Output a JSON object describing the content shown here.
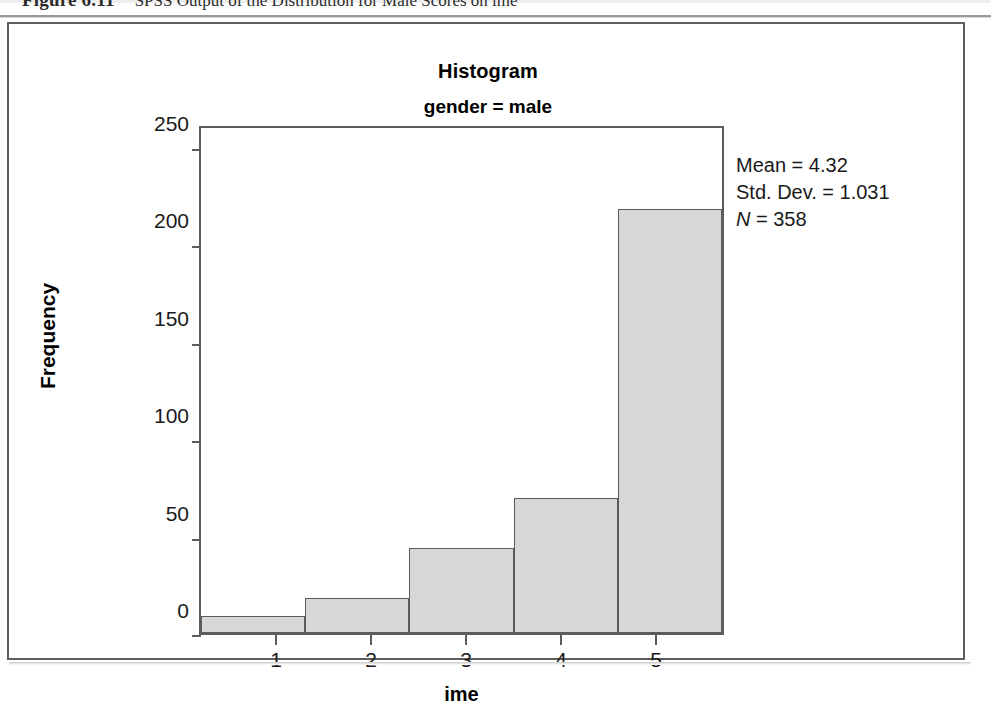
{
  "caption": {
    "label": "Figure 6.11",
    "text": "SPSS Output of the Distribution for Male Scores on ime"
  },
  "chart": {
    "title": "Histogram",
    "subtitle": "gender = male"
  },
  "stats": {
    "mean_label": "Mean = 4.32",
    "stddev_label": "Std. Dev. = 1.031",
    "n_symbol": "N",
    "n_value": " = 358"
  },
  "axes": {
    "y_title": "Frequency",
    "x_title": "ime",
    "y_ticks": [
      "250",
      "200",
      "150",
      "100",
      "50",
      "0"
    ],
    "x_ticks": [
      "1",
      "2",
      "3",
      "4",
      "5"
    ]
  },
  "chart_data": {
    "type": "bar",
    "title": "Histogram",
    "subtitle": "gender = male",
    "xlabel": "ime",
    "ylabel": "Frequency",
    "categories": [
      "1",
      "2",
      "3",
      "4",
      "5"
    ],
    "values": [
      9,
      18,
      44,
      70,
      220
    ],
    "ylim": [
      0,
      262
    ],
    "xlim": [
      0.5,
      5.5
    ],
    "ytick_values": [
      0,
      50,
      100,
      150,
      200,
      250
    ],
    "xtick_values": [
      1,
      2,
      3,
      4,
      5
    ],
    "grid": false,
    "legend": "none",
    "bar_fill_color": "#d7d7d7",
    "bar_edge_color": "#5a5a5a",
    "annotations": [
      "Mean = 4.32",
      "Std. Dev. = 1.031",
      "N = 358"
    ],
    "statistics": {
      "mean": 4.32,
      "std_dev": 1.031,
      "n": 358
    }
  }
}
